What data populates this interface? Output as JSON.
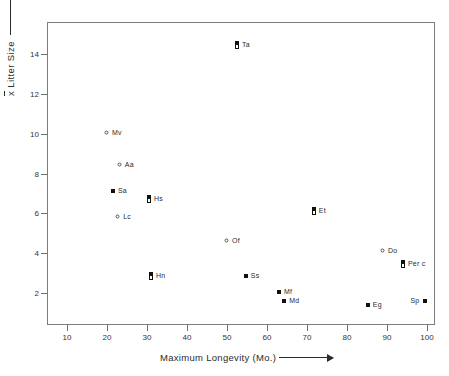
{
  "chart_data": {
    "type": "scatter",
    "title": "",
    "xlabel": "Maximum Longevity (Mo.)",
    "ylabel": "x̄ Litter Size",
    "ylabel_prefix": "x",
    "ylabel_rest": " Litter Size",
    "xlim": [
      5,
      102
    ],
    "ylim": [
      0.4,
      15.6
    ],
    "xticks": [
      10,
      20,
      30,
      40,
      50,
      60,
      70,
      80,
      90,
      100
    ],
    "yticks": [
      2,
      4,
      6,
      8,
      10,
      12,
      14
    ],
    "grid": false,
    "legend": "none",
    "marker_types": [
      "filled-square",
      "open-circle",
      "half-filled-square"
    ],
    "points": [
      {
        "label": "Ta",
        "x": 52.5,
        "y": 14.45,
        "marker": "half-filled-square",
        "label_side": "right"
      },
      {
        "label": "Mv",
        "x": 20.0,
        "y": 10.05,
        "marker": "open-circle",
        "label_side": "right"
      },
      {
        "label": "Aa",
        "x": 23.2,
        "y": 8.45,
        "marker": "open-circle",
        "label_side": "right"
      },
      {
        "label": "Sa",
        "x": 21.5,
        "y": 7.1,
        "marker": "filled-square",
        "label_side": "right"
      },
      {
        "label": "Hs",
        "x": 30.5,
        "y": 6.7,
        "marker": "half-filled-square",
        "label_side": "right"
      },
      {
        "label": "Lc",
        "x": 22.8,
        "y": 5.8,
        "marker": "open-circle",
        "label_side": "right"
      },
      {
        "label": "Et",
        "x": 71.7,
        "y": 6.12,
        "marker": "half-filled-square",
        "label_side": "right"
      },
      {
        "label": "Of",
        "x": 50.0,
        "y": 4.62,
        "marker": "open-circle",
        "label_side": "right"
      },
      {
        "label": "Do",
        "x": 89.0,
        "y": 4.1,
        "marker": "open-circle",
        "label_side": "right"
      },
      {
        "label": "Per c",
        "x": 94.0,
        "y": 3.48,
        "marker": "half-filled-square",
        "label_side": "right"
      },
      {
        "label": "Hn",
        "x": 31.0,
        "y": 2.88,
        "marker": "half-filled-square",
        "label_side": "right"
      },
      {
        "label": "Ss",
        "x": 54.7,
        "y": 2.88,
        "marker": "filled-square",
        "label_side": "right"
      },
      {
        "label": "Mf",
        "x": 63.0,
        "y": 2.08,
        "marker": "filled-square",
        "label_side": "right"
      },
      {
        "label": "Md",
        "x": 64.3,
        "y": 1.62,
        "marker": "filled-square",
        "label_side": "right"
      },
      {
        "label": "Eg",
        "x": 85.2,
        "y": 1.38,
        "marker": "filled-square",
        "label_side": "right"
      },
      {
        "label": "Sp",
        "x": 99.6,
        "y": 1.6,
        "marker": "filled-square",
        "label_side": "left"
      }
    ]
  },
  "colors": {
    "axis": "#7d7d7d",
    "tick": "#6f6f6f",
    "text": "#2b2b2b",
    "marker_fill": "#111111",
    "marker_stroke": "#555555",
    "background": "#ffffff"
  }
}
